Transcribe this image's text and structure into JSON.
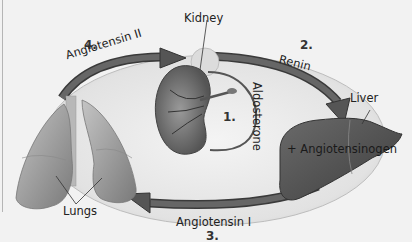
{
  "diagram": {
    "type": "renin-angiotensin-aldosterone cycle",
    "organs": {
      "kidney": "Kidney",
      "liver": "Liver",
      "lungs": "Lungs"
    },
    "steps": [
      {
        "number": "1.",
        "label": "Aldosterone"
      },
      {
        "number": "2.",
        "label": "Renin"
      },
      {
        "number": "3.",
        "label": "Angiotensin I"
      },
      {
        "number": "4.",
        "label": "Angiotensin II"
      }
    ],
    "liver_annotation": "+ Angiotensinogen",
    "colors": {
      "background": "#f2f2f2",
      "arrow_fill": "#5a5a5a",
      "arrow_edge": "#3a3a3a",
      "organ_dark": "#4a4a4a",
      "organ_light": "#a8a8a8",
      "inner_ring": "#e4e4e4",
      "text": "#222222"
    }
  }
}
